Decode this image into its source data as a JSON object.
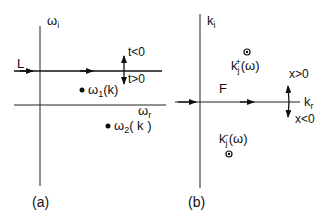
{
  "panel_a": {
    "caption": "(a)",
    "axis_y": {
      "symbol": "ω",
      "sub": "i"
    },
    "axis_x": {
      "symbol": "ω",
      "sub": "r"
    },
    "contour_label": "L",
    "arrow_up_label": "t<0",
    "arrow_down_label": "t>0",
    "pole1": {
      "symbol": "ω",
      "sub": "1",
      "arg": "(k)"
    },
    "pole2": {
      "symbol": "ω",
      "sub": "2",
      "arg": "( k )"
    }
  },
  "panel_b": {
    "caption": "(b)",
    "axis_y": {
      "symbol": "k",
      "sub": "i"
    },
    "axis_x": {
      "symbol": "k",
      "sub": "r"
    },
    "contour_label": "F",
    "arrow_up_label": "x>0",
    "arrow_down_label": "x<0",
    "root_plus": {
      "symbol": "k",
      "sub": "j",
      "sup": "+",
      "arg": "(ω)"
    },
    "root_minus": {
      "symbol": "k",
      "sub": "j",
      "sup": "−",
      "arg": "(ω)"
    }
  },
  "colors": {
    "ink": "#111111",
    "background": "#ffffff"
  }
}
